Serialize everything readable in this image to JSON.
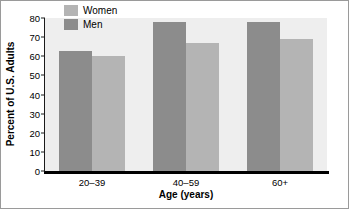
{
  "chart_data": {
    "type": "bar",
    "title": "",
    "xlabel": "Age (years)",
    "ylabel": "Percent of U.S. Adults",
    "categories": [
      "20–39",
      "40–59",
      "60+"
    ],
    "series": [
      {
        "name": "Men",
        "values": [
          63,
          78,
          78
        ],
        "color": "#8c8c8c"
      },
      {
        "name": "Women",
        "values": [
          60,
          67,
          69
        ],
        "color": "#b4b4b4"
      }
    ],
    "legend_order": [
      "Women",
      "Men"
    ],
    "bar_order_in_group": [
      "Men",
      "Women"
    ],
    "ylim": [
      0,
      80
    ],
    "ytick_values": [
      0,
      10,
      20,
      30,
      40,
      50,
      60,
      70,
      80
    ],
    "ytick_labels": [
      "0",
      "10",
      "20",
      "30",
      "40",
      "50",
      "60",
      "70",
      "80"
    ],
    "grid": false,
    "legend_position": "upper-left-inside",
    "plot_background": "#eeeeee",
    "axis_color": "#1a1a1a"
  }
}
